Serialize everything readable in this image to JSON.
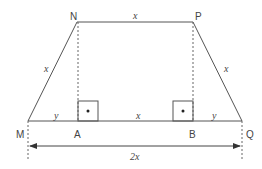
{
  "diagram": {
    "type": "trapezoid-geometry",
    "stroke_color": "#555555",
    "points": {
      "N": {
        "label": "N",
        "x": 77,
        "y": 22
      },
      "P": {
        "label": "P",
        "x": 193,
        "y": 22
      },
      "M": {
        "label": "M",
        "x": 28,
        "y": 121
      },
      "Q": {
        "label": "Q",
        "x": 242,
        "y": 121
      },
      "A": {
        "label": "A",
        "x": 78,
        "y": 121
      },
      "B": {
        "label": "B",
        "x": 193,
        "y": 121
      }
    },
    "segment_labels": {
      "NP": "x",
      "MN": "x",
      "PQ": "x",
      "MA": "y",
      "AB": "x",
      "BQ": "y",
      "MQ_dimension": "2x"
    },
    "right_angle_markers": [
      "A",
      "B"
    ]
  }
}
